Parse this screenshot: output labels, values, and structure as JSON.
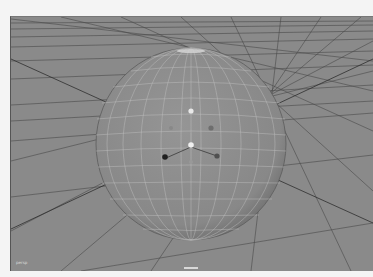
{
  "viewport": {
    "name": "3D perspective viewport",
    "background": "#8a8a8a",
    "grid_color": "#3c3c3c",
    "corner_label": "persp",
    "object": {
      "type": "polygon sphere",
      "wireframe_color": "#c8c8c8",
      "fill_color": "#8e8e8e"
    },
    "manipulator_points": [
      {
        "color": "#e8e8e8"
      },
      {
        "color": "#6e6e6e"
      },
      {
        "color": "#f0f0f0"
      },
      {
        "color": "#202020"
      },
      {
        "color": "#505050"
      },
      {
        "color": "#999999"
      }
    ]
  }
}
